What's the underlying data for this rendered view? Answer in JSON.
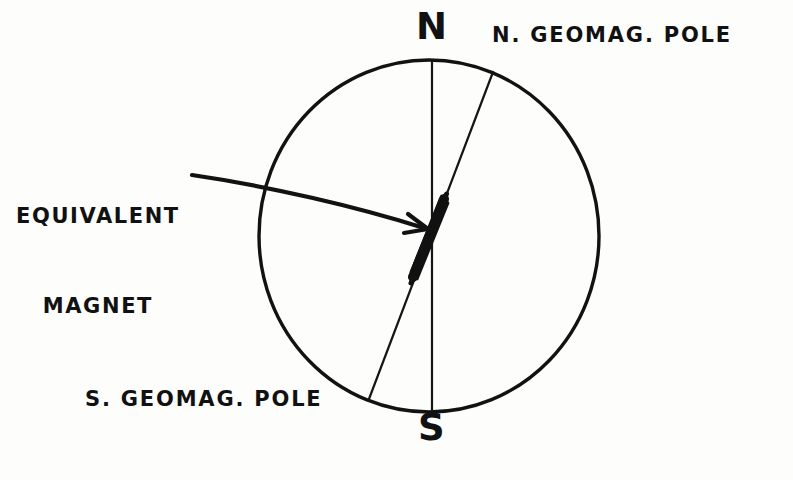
{
  "figure": {
    "background_color": "#fdfdfc",
    "ink_color": "#111111",
    "width": 793,
    "height": 480
  },
  "labels": {
    "north_geographic_pole": "N",
    "south_geographic_pole": "S",
    "north_geomagnetic_pole": "N. GEOMAG. POLE",
    "south_geomagnetic_pole": "S. GEOMAG. POLE",
    "equivalent_magnet_line1": "EQUIVALENT",
    "equivalent_magnet_line2": "MAGNET"
  },
  "geometry": {
    "earth_circle": {
      "cx": 429,
      "cy": 236,
      "r": 176,
      "stroke_width": 3.4
    },
    "rotation_axis": {
      "x1": 432,
      "y1": 60,
      "x2": 432,
      "y2": 412,
      "stroke_width": 2.2
    },
    "geomagnetic_axis": {
      "x1": 493,
      "y1": 72,
      "x2": 369,
      "y2": 399,
      "stroke_width": 2.2
    },
    "magnet_bar": {
      "x1": 446,
      "y1": 199,
      "x2": 412,
      "y2": 278,
      "thickness": 10
    },
    "pointer_arrow": {
      "start_x": 192,
      "start_y": 175,
      "end_x": 427,
      "end_y": 229,
      "stroke_width": 4
    }
  }
}
